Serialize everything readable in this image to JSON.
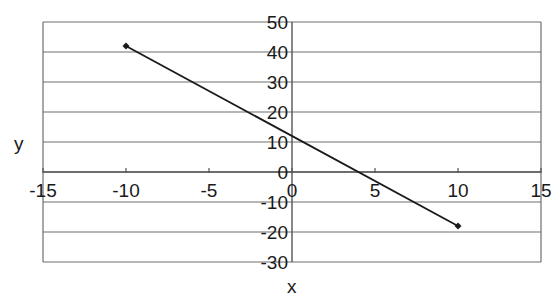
{
  "chart_data": {
    "type": "scatter",
    "title": "",
    "xlabel": "x",
    "ylabel": "y",
    "xlim": [
      -15,
      15
    ],
    "ylim": [
      -30,
      50
    ],
    "xticks": [
      -15,
      -10,
      -5,
      0,
      5,
      10,
      15
    ],
    "yticks": [
      50,
      40,
      30,
      20,
      10,
      0,
      -10,
      -20,
      -30
    ],
    "grid": {
      "horizontal": true,
      "vertical": false
    },
    "legend": null,
    "series": [
      {
        "name": "y = -3x + 12",
        "mode": "lines+markers",
        "x": [
          -10,
          10
        ],
        "y": [
          42,
          -18
        ],
        "color": "#1a1a1a"
      }
    ]
  },
  "colors": {
    "grid": "#6e6e6e",
    "line": "#1a1a1a",
    "background": "#ffffff"
  }
}
